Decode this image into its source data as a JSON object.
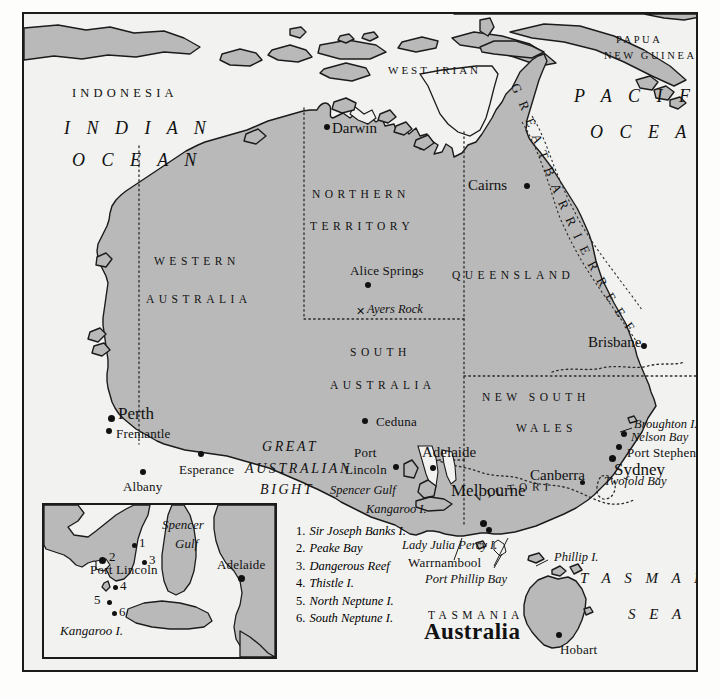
{
  "map": {
    "title": "Australia",
    "colors": {
      "land": "#b9b9b9",
      "ocean": "#f2f2f0",
      "outline": "#1b1b1b",
      "text": "#111111",
      "paper": "#fdfdfc"
    },
    "countries": [
      {
        "name": "INDONESIA",
        "x": 48,
        "y": 80
      },
      {
        "name": "WEST IRIAN",
        "x": 376,
        "y": 56
      },
      {
        "name": "PAPUA",
        "x": 602,
        "y": 28
      },
      {
        "name": "NEW GUINEA",
        "x": 592,
        "y": 45
      }
    ],
    "oceans": [
      {
        "name": "I N D I A N",
        "x": 50,
        "y": 110
      },
      {
        "name": "O C E A N",
        "x": 56,
        "y": 141
      },
      {
        "name": "P A C I F I C",
        "x": 566,
        "y": 87
      },
      {
        "name": "O C E A N",
        "x": 582,
        "y": 121
      },
      {
        "name": "T A S M A N",
        "x": 584,
        "y": 565
      },
      {
        "name": "S E A",
        "x": 634,
        "y": 603
      }
    ],
    "states": [
      {
        "name": "NORTHERN",
        "x": 312,
        "y": 180
      },
      {
        "name": "TERRITORY",
        "x": 310,
        "y": 212
      },
      {
        "name": "WESTERN",
        "x": 152,
        "y": 247
      },
      {
        "name": "AUSTRALIA",
        "x": 145,
        "y": 285
      },
      {
        "name": "QUEENSLAND",
        "x": 450,
        "y": 261
      },
      {
        "name": "SOUTH",
        "x": 348,
        "y": 338
      },
      {
        "name": "AUSTRALIA",
        "x": 330,
        "y": 371
      },
      {
        "name": "NEW SOUTH",
        "x": 482,
        "y": 383
      },
      {
        "name": "WALES",
        "x": 514,
        "y": 414
      },
      {
        "name": "VICTORIA",
        "x": 487,
        "y": 470
      },
      {
        "name": "TASMANIA",
        "x": 432,
        "y": 601
      }
    ],
    "cities": [
      {
        "name": "Darwin",
        "label_x": 330,
        "label_y": 116,
        "dot_x": 322,
        "dot_y": 119,
        "size": "md"
      },
      {
        "name": "Cairns",
        "label_x": 466,
        "label_y": 172,
        "dot_x": 522,
        "dot_y": 178,
        "size": "md"
      },
      {
        "name": "Alice Springs",
        "label_x": 348,
        "label_y": 258,
        "dot_x": 363,
        "dot_y": 277,
        "size": "city"
      },
      {
        "name": "Brisbane",
        "label_x": 586,
        "label_y": 330,
        "dot_x": 639,
        "dot_y": 338,
        "size": "md"
      },
      {
        "name": "Perth",
        "label_x": 116,
        "label_y": 402,
        "dot_x": 106,
        "dot_y": 413,
        "size": "lg"
      },
      {
        "name": "Fremantle",
        "label_x": 114,
        "label_y": 422,
        "dot_x": 104,
        "dot_y": 424,
        "size": "city"
      },
      {
        "name": "Albany",
        "label_x": 121,
        "label_y": 475,
        "dot_x": 138,
        "dot_y": 466,
        "size": "city"
      },
      {
        "name": "Esperance",
        "label_x": 177,
        "label_y": 458,
        "dot_x": 196,
        "dot_y": 448,
        "size": "city"
      },
      {
        "name": "Ceduna",
        "label_x": 374,
        "label_y": 410,
        "dot_x": 360,
        "dot_y": 414,
        "size": "city"
      },
      {
        "name": "Port",
        "label_x": 352,
        "label_y": 441,
        "dot_x": 391,
        "dot_y": 458,
        "size": "city"
      },
      {
        "name": "Lincoln",
        "label_x": 343,
        "label_y": 458,
        "dot_x": -1,
        "dot_y": -1,
        "size": "city"
      },
      {
        "name": "Adelaide",
        "label_x": 420,
        "label_y": 440,
        "dot_x": 428,
        "dot_y": 461,
        "size": "md"
      },
      {
        "name": "Melbourne",
        "label_x": 449,
        "label_y": 478,
        "dot_x": 478,
        "dot_y": 516,
        "size": "lg"
      },
      {
        "name": "Canberra",
        "label_x": 528,
        "label_y": 463,
        "dot_x": 578,
        "dot_y": 475,
        "size": "md"
      },
      {
        "name": "Sydney",
        "label_x": 612,
        "label_y": 458,
        "dot_x": 607,
        "dot_y": 452,
        "size": "lg"
      },
      {
        "name": "Port Stephens",
        "label_x": 625,
        "label_y": 442,
        "dot_x": 613,
        "dot_y": 440,
        "size": "city"
      },
      {
        "name": "Nelson Bay",
        "label_x": 629,
        "label_y": 427,
        "dot_x": -1,
        "dot_y": -1,
        "size": "city"
      },
      {
        "name": "Warrnambool",
        "label_x": 406,
        "label_y": 551,
        "dot_x": 484,
        "dot_y": 523,
        "size": "city"
      },
      {
        "name": "Hobart",
        "label_x": 558,
        "label_y": 638,
        "dot_x": 554,
        "dot_y": 628,
        "size": "city"
      }
    ],
    "features": [
      {
        "name": "Ayers Rock",
        "x": 365,
        "y": 297,
        "mark_x": 356,
        "mark_y": 302
      },
      {
        "name": "GREAT",
        "x": 260,
        "y": 434,
        "kind": "bight"
      },
      {
        "name": "AUSTRALIAN",
        "x": 243,
        "y": 455,
        "kind": "bight"
      },
      {
        "name": "BIGHT",
        "x": 258,
        "y": 477,
        "kind": "bight"
      },
      {
        "name": "Spencer Gulf",
        "x": 328,
        "y": 478,
        "kind": "italic"
      },
      {
        "name": "Kangaroo I.",
        "x": 364,
        "y": 497,
        "kind": "italic"
      },
      {
        "name": "Broughton I.",
        "x": 632,
        "y": 413,
        "kind": "italic"
      },
      {
        "name": "Twofold Bay",
        "x": 602,
        "y": 470,
        "kind": "italic"
      },
      {
        "name": "Phillip I.",
        "x": 552,
        "y": 546,
        "kind": "italic"
      },
      {
        "name": "Lady Julia Percy I.",
        "x": 400,
        "y": 534,
        "kind": "italic"
      },
      {
        "name": "Port Phillip Bay",
        "x": 423,
        "y": 568,
        "kind": "italic"
      }
    ],
    "reef_label": "GREATBARRIERREEF",
    "reef_label_text": "G R E A T   B A R R I E R   R E E F"
  },
  "inset": {
    "labels": [
      {
        "name": "Spencer",
        "x": 140,
        "y": 505,
        "kind": "italic"
      },
      {
        "name": "Gulf",
        "x": 152,
        "y": 524,
        "kind": "italic"
      },
      {
        "name": "Port Lincoln",
        "x": 66,
        "y": 550,
        "kind": "plain"
      },
      {
        "name": "Adelaide",
        "x": 221,
        "y": 546,
        "kind": "plain"
      },
      {
        "name": "Kangaroo I.",
        "x": 40,
        "y": 613,
        "kind": "italic"
      }
    ],
    "points": [
      {
        "num": "1",
        "dot_x": 130,
        "dot_y": 530,
        "label_x": 136,
        "label_y": 524
      },
      {
        "num": "2",
        "dot_x": 98,
        "dot_y": 545,
        "label_x": 107,
        "label_y": 537
      },
      {
        "num": "3",
        "dot_x": 140,
        "dot_y": 546,
        "label_x": 147,
        "label_y": 540
      },
      {
        "num": "4",
        "dot_x": 111,
        "dot_y": 572,
        "label_x": 117,
        "label_y": 566
      },
      {
        "num": "5",
        "dot_x": 105,
        "dot_y": 586,
        "label_x": 92,
        "label_y": 579
      },
      {
        "num": "6",
        "dot_x": 110,
        "dot_y": 597,
        "label_x": 117,
        "label_y": 591
      }
    ],
    "city_dots": [
      {
        "name": "Port Lincoln",
        "x": 96,
        "y": 543
      },
      {
        "name": "Adelaide",
        "x": 236,
        "y": 562
      }
    ]
  },
  "legend": {
    "items": [
      {
        "num": "1.",
        "label": "Sir Joseph Banks I."
      },
      {
        "num": "2.",
        "label": "Peake Bay"
      },
      {
        "num": "3.",
        "label": "Dangerous Reef"
      },
      {
        "num": "4.",
        "label": "Thistle I."
      },
      {
        "num": "5.",
        "label": "North Neptune I."
      },
      {
        "num": "6.",
        "label": "South Neptune I."
      }
    ]
  }
}
